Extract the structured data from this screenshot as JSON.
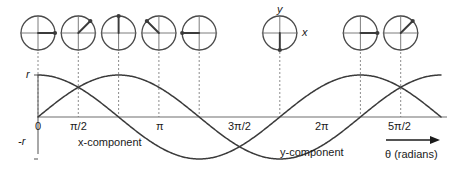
{
  "figure": {
    "colors": {
      "curve": "#3b3b3b",
      "axis": "#6e6e6e",
      "circle": "#4a4a4a",
      "vector": "#3b3b3b",
      "dotted": "#8c8c8c",
      "text": "#1a1a1a",
      "background": "#ffffff"
    }
  },
  "chart_data": {
    "type": "line",
    "title": "",
    "xlabel": "θ (radians)",
    "ylabel": "",
    "grid": false,
    "legend": "inline-annotations",
    "xlim": [
      0,
      7.853981634
    ],
    "ylim": [
      -1,
      1
    ],
    "xticks": [
      0,
      1.570796327,
      3.141592654,
      4.71238898,
      6.283185307,
      7.853981634
    ],
    "xticklabels": [
      "0",
      "π/2",
      "π",
      "3π/2",
      "2π",
      "5π/2"
    ],
    "yticks": [
      1,
      -1
    ],
    "yticklabels": [
      "r",
      "-r"
    ],
    "series": [
      {
        "name": "x-component",
        "function": "r cos(θ)",
        "x": [
          0,
          0.3927,
          0.7854,
          1.1781,
          1.5708,
          1.9635,
          2.3562,
          2.7489,
          3.1416,
          3.5343,
          3.927,
          4.3197,
          4.7124,
          5.1051,
          5.4978,
          5.8905,
          6.2832,
          6.6759,
          7.0686,
          7.4613,
          7.854
        ],
        "y": [
          1,
          0.9239,
          0.7071,
          0.3827,
          0,
          -0.3827,
          -0.7071,
          -0.9239,
          -1,
          -0.9239,
          -0.7071,
          -0.3827,
          0,
          0.3827,
          0.7071,
          0.9239,
          1,
          0.9239,
          0.7071,
          0.3827,
          0
        ]
      },
      {
        "name": "y-component",
        "function": "r sin(θ)",
        "x": [
          0,
          0.3927,
          0.7854,
          1.1781,
          1.5708,
          1.9635,
          2.3562,
          2.7489,
          3.1416,
          3.5343,
          3.927,
          4.3197,
          4.7124,
          5.1051,
          5.4978,
          5.8905,
          6.2832,
          6.6759,
          7.0686,
          7.4613,
          7.854
        ],
        "y": [
          0,
          0.3827,
          0.7071,
          0.9239,
          1,
          0.9239,
          0.7071,
          0.3827,
          0,
          -0.3827,
          -0.7071,
          -0.9239,
          -1,
          -0.9239,
          -0.7071,
          -0.3827,
          0,
          0.3827,
          0.7071,
          0.9239,
          1
        ]
      }
    ],
    "annotations": [
      {
        "text": "x-component",
        "x": 1.1,
        "y": -0.55
      },
      {
        "text": "y-component",
        "x": 5.1,
        "y": -0.78
      }
    ]
  },
  "phasors": {
    "description": "Unit-circle phasor diagrams above the plot showing the vector direction at each marked angle",
    "radius_label": "r",
    "axis_labels": {
      "y": "y",
      "x": "x"
    },
    "items": [
      {
        "angle_label": "0",
        "angle_rad": 0,
        "angle_deg": 0,
        "has_axis_labels": false
      },
      {
        "angle_label": "π/4",
        "angle_rad": 0.785398163,
        "angle_deg": 45,
        "has_axis_labels": false
      },
      {
        "angle_label": "π/2",
        "angle_rad": 1.570796327,
        "angle_deg": 90,
        "has_axis_labels": false
      },
      {
        "angle_label": "3π/4",
        "angle_rad": 2.35619449,
        "angle_deg": 135,
        "has_axis_labels": false
      },
      {
        "angle_label": "π",
        "angle_rad": 3.141592654,
        "angle_deg": 180,
        "has_axis_labels": false
      },
      {
        "angle_label": "3π/2",
        "angle_rad": 4.71238898,
        "angle_deg": 270,
        "has_axis_labels": true
      },
      {
        "angle_label": "2π",
        "angle_rad": 6.283185307,
        "angle_deg": 360,
        "has_axis_labels": false
      },
      {
        "angle_label": "9π/4",
        "angle_rad": 7.068583471,
        "angle_deg": 405,
        "has_axis_labels": false
      }
    ]
  },
  "labels": {
    "y_top": "r",
    "y_bottom": "-r",
    "x_ticks": [
      "0",
      "π/2",
      "π",
      "3π/2",
      "2π",
      "5π/2"
    ],
    "x_component": "x-component",
    "y_component": "y-component",
    "theta_axis": "θ (radians)",
    "circle_y": "y",
    "circle_x": "x"
  }
}
